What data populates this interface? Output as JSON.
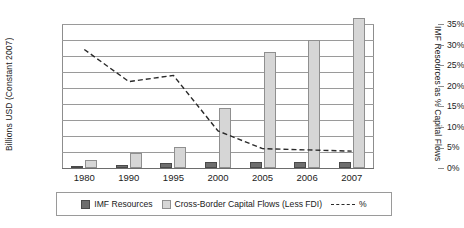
{
  "chart_data": {
    "type": "bar",
    "title": "",
    "categories": [
      "1980",
      "1990",
      "1995",
      "2000",
      "2005",
      "2006",
      "2007"
    ],
    "series": [
      {
        "name": "IMF Resources",
        "axis": "left",
        "values": [
          150,
          180,
          300,
          360,
          400,
          370,
          390
        ],
        "color": "#6e6e6e"
      },
      {
        "name": "Cross-Border Capital Flows (Less FDI)",
        "axis": "left",
        "values": [
          500,
          950,
          1320,
          3730,
          7250,
          8000,
          9400
        ],
        "color": "#d6d6d6"
      },
      {
        "name": "%",
        "axis": "right",
        "type": "line",
        "style": "dashed",
        "values": [
          28.8,
          21.0,
          22.5,
          9.0,
          4.7,
          4.4,
          4.1
        ],
        "color": "#2a2a2a"
      }
    ],
    "ylabel": "Billions USD (Constant 2007)",
    "y2label": "IMF Resources as % Capital Flows",
    "xlabel": "",
    "ylim": [
      0,
      9000
    ],
    "y2lim": [
      0,
      35
    ],
    "yticks": [
      "$0",
      "$1,000",
      "$2,000",
      "$3,000",
      "$4,000",
      "$5,000",
      "$6,000",
      "$7,000",
      "$8,000",
      "$9,000"
    ],
    "ytick_values": [
      0,
      1000,
      2000,
      3000,
      4000,
      5000,
      6000,
      7000,
      8000,
      9000
    ],
    "y2ticks": [
      "0%",
      "5%",
      "10%",
      "15%",
      "20%",
      "25%",
      "30%",
      "35%"
    ],
    "y2tick_values": [
      0,
      5,
      10,
      15,
      20,
      25,
      30,
      35
    ],
    "grid": true,
    "legend_position": "bottom"
  },
  "legend": {
    "items": [
      {
        "label": "IMF Resources",
        "swatch": "dark"
      },
      {
        "label": "Cross-Border Capital Flows (Less FDI)",
        "swatch": "light"
      },
      {
        "label": "%",
        "swatch": "line"
      }
    ]
  }
}
